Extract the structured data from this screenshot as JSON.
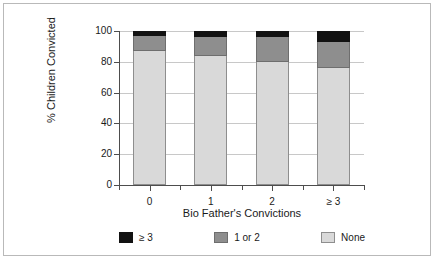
{
  "chart_data": {
    "type": "bar",
    "subtype": "stacked-bar-100",
    "title": "",
    "xlabel": "Bio Father's Convictions",
    "ylabel": "% Children Convicted",
    "categories": [
      "0",
      "1",
      "2",
      "≥ 3"
    ],
    "series": [
      {
        "name": "None",
        "color": "#d9d9d9",
        "values": [
          87,
          84,
          80,
          76
        ]
      },
      {
        "name": "1 or 2",
        "color": "#8e8e8e",
        "values": [
          10,
          12,
          16,
          17
        ]
      },
      {
        "name": "≥ 3",
        "color": "#121212",
        "values": [
          3,
          4,
          4,
          7
        ]
      }
    ],
    "stack_order_bottom_to_top": [
      "None",
      "1 or 2",
      "≥ 3"
    ],
    "ylim": [
      0,
      100
    ],
    "yticks": [
      0,
      20,
      40,
      60,
      80,
      100
    ],
    "ytick_labels": [
      "0",
      "20",
      "40",
      "60",
      "80",
      "100"
    ],
    "grid": true,
    "grid_axis": "y",
    "legend_position": "bottom",
    "legend_order": [
      "≥ 3",
      "1 or 2",
      "None"
    ]
  },
  "legend": {
    "items": [
      {
        "label": "≥ 3",
        "swatch": "black-swatch"
      },
      {
        "label": "1 or 2",
        "swatch": "gray-swatch"
      },
      {
        "label": "None",
        "swatch": "light-gray-swatch"
      }
    ]
  },
  "colors": {
    "segment_none": "#d9d9d9",
    "segment_one_or_two": "#8e8e8e",
    "segment_three_plus": "#121212",
    "axis": "#4d4d4d",
    "grid": "#c8c8c8",
    "frame": "#b9b9b9"
  }
}
